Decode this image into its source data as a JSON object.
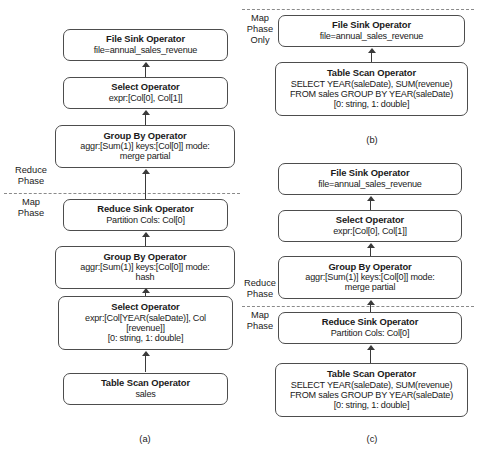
{
  "figure": {
    "background_color": "#ffffff",
    "box_border_color": "#4d4d4d",
    "arrow_color": "#3a3a3a",
    "divider_color": "#8a8a8a"
  },
  "panel_a": {
    "caption": "(a)",
    "phase_labels": [
      {
        "line1": "Reduce",
        "line2": "Phase"
      },
      {
        "line1": "Map",
        "line2": "Phase"
      }
    ],
    "nodes": [
      {
        "title": "File Sink Operator",
        "lines": [
          "file=annual_sales_revenue"
        ]
      },
      {
        "title": "Select Operator",
        "lines": [
          "expr:[Col[0], Col[1]]"
        ]
      },
      {
        "title": "Group By Operator",
        "lines": [
          "aggr:[Sum(1)]  keys:[Col[0]]  mode:",
          "merge partial"
        ]
      },
      {
        "title": "Reduce Sink Operator",
        "lines": [
          "Partition Cols: Col[0]"
        ]
      },
      {
        "title": "Group By Operator",
        "lines": [
          "aggr:[Sum(1)]  keys:[Col[0]] mode:",
          "hash"
        ]
      },
      {
        "title": "Select Operator",
        "lines": [
          "expr:[Col[YEAR(saleDate)], Col",
          "[revenue]]",
          "[0: string, 1: double]"
        ]
      },
      {
        "title": "Table Scan Operator",
        "lines": [
          "sales"
        ]
      }
    ]
  },
  "panel_b": {
    "caption": "(b)",
    "phase_labels": [
      {
        "line1": "Map",
        "line2": "Phase",
        "line3": "Only"
      }
    ],
    "nodes": [
      {
        "title": "File Sink Operator",
        "lines": [
          "file=annual_sales_revenue"
        ]
      },
      {
        "title": "Table Scan Operator",
        "lines": [
          "SELECT YEAR(saleDate), SUM(revenue)",
          "FROM sales GROUP BY YEAR(saleDate)",
          "[0: string, 1: double]"
        ]
      }
    ]
  },
  "panel_c": {
    "caption": "(c)",
    "phase_labels": [
      {
        "line1": "Reduce",
        "line2": "Phase"
      },
      {
        "line1": "Map",
        "line2": "Phase"
      }
    ],
    "nodes": [
      {
        "title": "File Sink Operator",
        "lines": [
          "file=annual_sales_revenue"
        ]
      },
      {
        "title": "Select Operator",
        "lines": [
          "expr:[Col[0], Col[1]]"
        ]
      },
      {
        "title": "Group By Operator",
        "lines": [
          "aggr:[Sum(1)]  keys:[Col[0]] mode:",
          "merge partial"
        ]
      },
      {
        "title": "Reduce Sink Operator",
        "lines": [
          "Partition Cols: Col[0]"
        ]
      },
      {
        "title": "Table Scan Operator",
        "lines": [
          "SELECT YEAR(saleDate), SUM(revenue)",
          "FROM sales GROUP BY YEAR(saleDate)",
          "[0: string, 1: double]"
        ]
      }
    ]
  }
}
